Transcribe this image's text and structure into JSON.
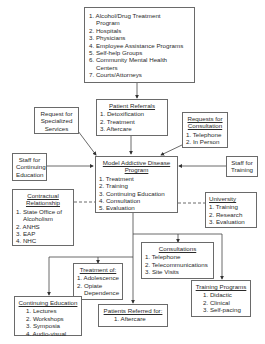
{
  "diagram": {
    "sources": {
      "items": [
        "1. Alcohol/Drug Treatment",
        "    Program",
        "2. Hospitals",
        "3. Physicians",
        "4. Employee Assistance Programs",
        "5. Self-help Groups",
        "6. Community Mental Health",
        "    Centers",
        "7. Courts/Attorneys"
      ]
    },
    "patient_referrals": {
      "title": "Patient Referrals",
      "items": [
        "1. Detoxification",
        "2. Treatment",
        "3. Aftercare"
      ]
    },
    "specialized_services": {
      "lines": [
        "Request for",
        "Specialized",
        "Services"
      ]
    },
    "consultation_requests": {
      "title_lines": [
        "Requests for",
        "Consultation"
      ],
      "items": [
        "1. Telephone",
        "2. In Person"
      ]
    },
    "staff_continuing_ed": {
      "lines": [
        "Staff for",
        "Continuing",
        "Education"
      ]
    },
    "staff_training": {
      "lines": [
        "Staff for",
        "Training"
      ]
    },
    "model_program": {
      "title_lines": [
        "Model Addictive Disease",
        "Program"
      ],
      "items": [
        "1. Treatment",
        "2. Training",
        "3. Continuing Education",
        "4. Consultation",
        "5. Evaluation"
      ]
    },
    "contractual": {
      "title_lines": [
        "Contractual",
        "Relationship"
      ],
      "items": [
        "1. State Office of",
        "    Alcoholism",
        "2. ANHS",
        "3. EAP",
        "4. NHC"
      ]
    },
    "university": {
      "title": "University",
      "items": [
        "1. Training",
        "2. Research",
        "3. Evaluation"
      ]
    },
    "consultations": {
      "title": "Consultations",
      "items": [
        "1. Telephone",
        "2. Telecommunications",
        "3. Site Visits"
      ]
    },
    "treatment_of": {
      "title": "Treatment of:",
      "items": [
        "1. Adolescence",
        "2. Opiate",
        "    Dependence"
      ]
    },
    "continuing_education": {
      "title": "Continuing Education",
      "items": [
        "1. Lectures",
        "2. Workshops",
        "3. Symposia",
        "4. Audio-visual"
      ]
    },
    "patients_referred": {
      "title": "Patients Referred for:",
      "items": [
        "1. Aftercare"
      ]
    },
    "training_programs": {
      "title": "Training Programs",
      "items": [
        "1. Didactic",
        "2. Clinical",
        "3. Self-pacing"
      ]
    }
  }
}
